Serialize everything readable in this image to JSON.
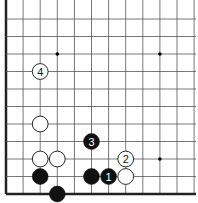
{
  "diagram": {
    "type": "go-board-corner",
    "grid": {
      "columns": 12,
      "rows": 11,
      "origin_x": 6,
      "origin_y": 194,
      "spacing_x": 17.1,
      "spacing_y": 17.5,
      "line_color": "#555555",
      "edge_color": "#222222"
    },
    "star_points": [
      {
        "col": 3,
        "row": 9
      },
      {
        "col": 9,
        "row": 9
      },
      {
        "col": 9,
        "row": 3
      }
    ],
    "stones": [
      {
        "color": "black",
        "col": 2,
        "row": 2,
        "label": ""
      },
      {
        "color": "black",
        "col": 3,
        "row": 1,
        "label": ""
      },
      {
        "color": "black",
        "col": 5,
        "row": 2,
        "label": ""
      },
      {
        "color": "black",
        "col": 6,
        "row": 2,
        "label": "1"
      },
      {
        "color": "white",
        "col": 7,
        "row": 2,
        "label": ""
      },
      {
        "color": "white",
        "col": 7,
        "row": 3,
        "label": "2"
      },
      {
        "color": "white",
        "col": 2,
        "row": 3,
        "label": ""
      },
      {
        "color": "white",
        "col": 3,
        "row": 3,
        "label": ""
      },
      {
        "color": "white",
        "col": 2,
        "row": 5,
        "label": ""
      },
      {
        "color": "black",
        "col": 5,
        "row": 4,
        "label": "3"
      },
      {
        "color": "white",
        "col": 2,
        "row": 8,
        "label": "4"
      }
    ]
  }
}
